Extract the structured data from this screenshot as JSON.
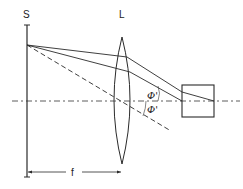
{
  "diagram": {
    "type": "optics-ray-diagram",
    "labels": {
      "source_plane": "S",
      "lens": "L",
      "focal_length": "f",
      "angle_upper": "Φ'",
      "angle_lower": "Φ'"
    },
    "elements": [
      "source plane S (vertical line)",
      "converging lens L",
      "optical axis (dash-dot)",
      "two refracted rays from a point on S",
      "dashed undeviated ray through lens center",
      "detector box on optical axis",
      "focal length dimension f between S and L"
    ],
    "colors": {
      "stroke": "#2a2a2a",
      "background": "#ffffff"
    }
  }
}
